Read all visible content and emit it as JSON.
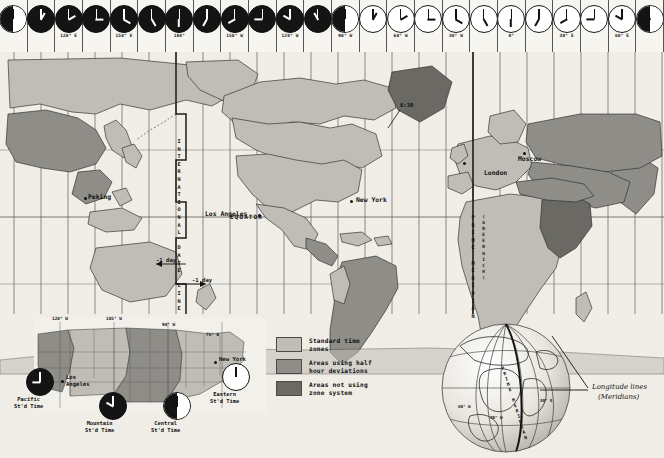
{
  "clock_strip": {
    "count": 24,
    "clocks": [
      {
        "hour": 12,
        "minute": 0,
        "shade": "half",
        "lon_label": ""
      },
      {
        "hour": 1,
        "minute": 0,
        "shade": "night",
        "lon_label": ""
      },
      {
        "hour": 2,
        "minute": 0,
        "shade": "night",
        "lon_label": "120° E"
      },
      {
        "hour": 3,
        "minute": 0,
        "shade": "night",
        "lon_label": ""
      },
      {
        "hour": 4,
        "minute": 0,
        "shade": "night",
        "lon_label": "150° E"
      },
      {
        "hour": 5,
        "minute": 0,
        "shade": "night",
        "lon_label": ""
      },
      {
        "hour": 6,
        "minute": 0,
        "shade": "night",
        "lon_label": "180°"
      },
      {
        "hour": 7,
        "minute": 0,
        "shade": "night",
        "lon_label": ""
      },
      {
        "hour": 8,
        "minute": 0,
        "shade": "night",
        "lon_label": "150° W"
      },
      {
        "hour": 9,
        "minute": 0,
        "shade": "night",
        "lon_label": ""
      },
      {
        "hour": 10,
        "minute": 0,
        "shade": "night",
        "lon_label": "120° W"
      },
      {
        "hour": 11,
        "minute": 0,
        "shade": "night",
        "lon_label": ""
      },
      {
        "hour": 12,
        "minute": 0,
        "shade": "half",
        "lon_label": "90° W"
      },
      {
        "hour": 1,
        "minute": 0,
        "shade": "day",
        "lon_label": ""
      },
      {
        "hour": 2,
        "minute": 0,
        "shade": "day",
        "lon_label": "60° W"
      },
      {
        "hour": 3,
        "minute": 0,
        "shade": "day",
        "lon_label": ""
      },
      {
        "hour": 4,
        "minute": 0,
        "shade": "day",
        "lon_label": "30° W"
      },
      {
        "hour": 5,
        "minute": 0,
        "shade": "day",
        "lon_label": ""
      },
      {
        "hour": 6,
        "minute": 0,
        "shade": "day",
        "lon_label": "0°"
      },
      {
        "hour": 7,
        "minute": 0,
        "shade": "day",
        "lon_label": ""
      },
      {
        "hour": 8,
        "minute": 0,
        "shade": "day",
        "lon_label": "30° E"
      },
      {
        "hour": 9,
        "minute": 0,
        "shade": "day",
        "lon_label": ""
      },
      {
        "hour": 10,
        "minute": 0,
        "shade": "day",
        "lon_label": "60° E"
      },
      {
        "hour": 11,
        "minute": 0,
        "shade": "half",
        "lon_label": ""
      }
    ]
  },
  "main_map": {
    "cities": [
      {
        "name": "Peking",
        "x": 90,
        "y": 148
      },
      {
        "name": "Los Angeles",
        "x": 236,
        "y": 165
      },
      {
        "name": "New York",
        "x": 355,
        "y": 152
      },
      {
        "name": "London",
        "x": 489,
        "y": 135
      },
      {
        "name": "Moscow",
        "x": 528,
        "y": 126
      }
    ],
    "annotations": {
      "date_line": "INTERNATIONAL DATE LINE",
      "prime_meridian": "PRIME MERIDIAN",
      "greenwich": "(GREENWICH)",
      "equator": "EQUATOR",
      "half_hour_zone": "6:30",
      "minus_day_upper": "-1 day",
      "minus_day_lower": "-1 day"
    }
  },
  "legend": {
    "items": [
      {
        "label": "Standard time\nzones",
        "color": "#bfbdb6"
      },
      {
        "label": "Areas using half\nhour deviations",
        "color": "#8e8d87"
      },
      {
        "label": "Areas not using\nzone system",
        "color": "#6a6964"
      }
    ]
  },
  "us_inset": {
    "lon_labels": [
      "120° W",
      "105° W",
      "90° W",
      "75° W"
    ],
    "cities": [
      {
        "name": "Los\nAngeles",
        "x": 44,
        "y": 56
      },
      {
        "name": "New York",
        "x": 185,
        "y": 41
      }
    ],
    "zones": [
      {
        "label": "Pacific\nSt'd Time",
        "hour": 9,
        "shade": "night"
      },
      {
        "label": "Mountain\nSt'd Time",
        "hour": 10,
        "shade": "night"
      },
      {
        "label": "Central\nSt'd Time",
        "hour": 11,
        "shade": "half"
      },
      {
        "label": "Eastern\nSt'd Time",
        "hour": 12,
        "shade": "day"
      }
    ]
  },
  "globe_inset": {
    "callout": "Longitude lines",
    "callout_sub": "(Meridians)",
    "prime_meridian": "PRIME MERIDIAN",
    "lon_labels": [
      "30° W",
      "30° E",
      "60° W"
    ]
  },
  "colors": {
    "land_standard": "#bfbdb6",
    "land_half": "#8e8d87",
    "land_none": "#6a6964",
    "ocean": "#f0eee7",
    "ink": "#111111"
  }
}
